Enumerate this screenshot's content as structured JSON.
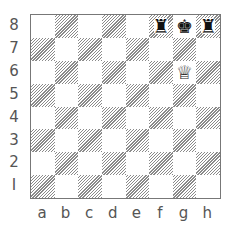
{
  "board": {
    "ranks": [
      "8",
      "7",
      "6",
      "5",
      "4",
      "3",
      "2",
      "1"
    ],
    "files": [
      "a",
      "b",
      "c",
      "d",
      "e",
      "f",
      "g",
      "h"
    ],
    "rank_label_for_1": "I",
    "colors": {
      "light": "#ffffff",
      "dark_hatch": "#8a8a8a",
      "border": "#777777",
      "label": "#555555"
    },
    "pieces": [
      {
        "square": "f8",
        "type": "rook",
        "color": "black",
        "glyph": "♜"
      },
      {
        "square": "g8",
        "type": "king",
        "color": "black",
        "glyph": "♚"
      },
      {
        "square": "h8",
        "type": "rook",
        "color": "black",
        "glyph": "♜"
      },
      {
        "square": "g6",
        "type": "queen",
        "color": "white",
        "glyph": "♕"
      }
    ]
  },
  "labels": {
    "ranks": [
      "8",
      "7",
      "6",
      "5",
      "4",
      "3",
      "2",
      "I"
    ],
    "files": [
      "a",
      "b",
      "c",
      "d",
      "e",
      "f",
      "g",
      "h"
    ]
  }
}
